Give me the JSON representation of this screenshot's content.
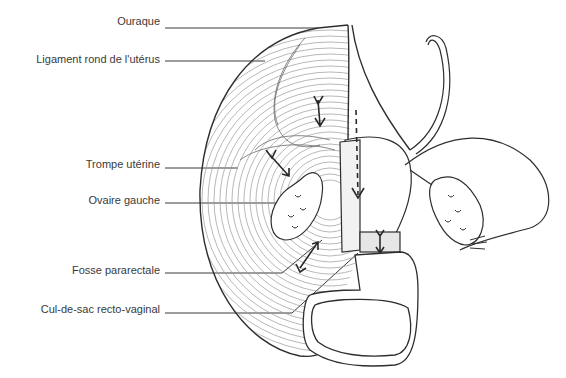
{
  "figure": {
    "labels": [
      {
        "id": "ouraque",
        "text": "Ouraque",
        "y": 22
      },
      {
        "id": "ligament-rond",
        "text": "Ligament rond de l'utérus",
        "y": 55
      },
      {
        "id": "trompe",
        "text": "Trompe utérine",
        "y": 160
      },
      {
        "id": "ovaire",
        "text": "Ovaire gauche",
        "y": 195
      },
      {
        "id": "fosse",
        "text": "Fosse pararectale",
        "y": 268
      },
      {
        "id": "cul-de-sac",
        "text": "Cul-de-sac recto-vaginal",
        "y": 308
      }
    ],
    "colors": {
      "ink": "#3a3a3a",
      "hatch": "#8a8a8a",
      "background": "#ffffff"
    }
  }
}
